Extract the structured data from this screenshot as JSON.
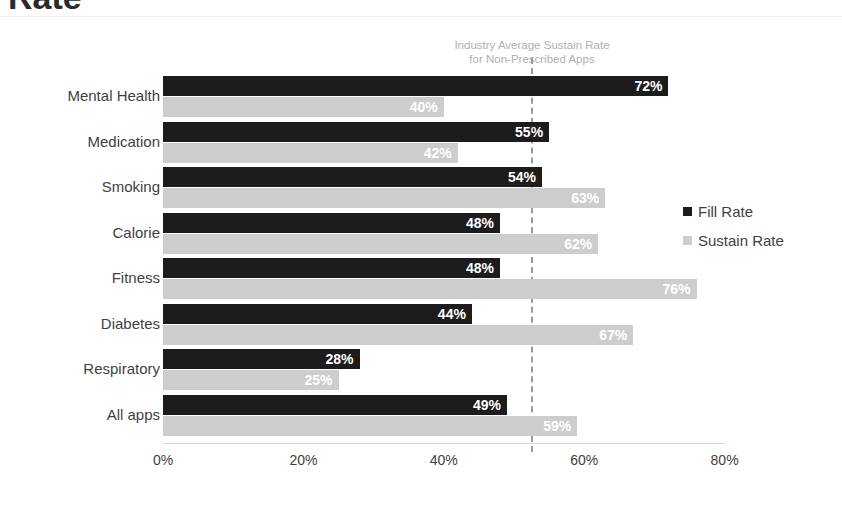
{
  "page": {
    "title_fragment": "Rate"
  },
  "legend": {
    "items": [
      {
        "label": "Fill Rate",
        "color": "#1c1c1c"
      },
      {
        "label": "Sustain Rate",
        "color": "#cdcdcd"
      }
    ]
  },
  "annotation": {
    "line1": "Industry Average Sustain Rate",
    "line2": "for Non-Prescribed Apps"
  },
  "chart_data": {
    "type": "bar",
    "orientation": "horizontal",
    "title": "Rate",
    "xlabel": "",
    "ylabel": "",
    "xlim": [
      0,
      85
    ],
    "grid": false,
    "legend_position": "right",
    "tick_labels": [
      "0%",
      "20%",
      "40%",
      "60%",
      "80%"
    ],
    "ticks": [
      0,
      20,
      40,
      60,
      80
    ],
    "categories": [
      "Mental Health",
      "Medication",
      "Smoking",
      "Calorie",
      "Fitness",
      "Diabetes",
      "Respiratory",
      "All apps"
    ],
    "series": [
      {
        "name": "Fill Rate",
        "color": "#1c1c1c",
        "values": [
          72,
          55,
          54,
          48,
          48,
          44,
          28,
          49
        ],
        "labels": [
          "72%",
          "55%",
          "54%",
          "48%",
          "48%",
          "44%",
          "28%",
          "49%"
        ]
      },
      {
        "name": "Sustain Rate",
        "color": "#cdcdcd",
        "values": [
          40,
          42,
          63,
          62,
          76,
          67,
          25,
          59
        ],
        "labels": [
          "40%",
          "42%",
          "63%",
          "62%",
          "76%",
          "67%",
          "25%",
          "59%"
        ]
      }
    ],
    "annotations": [
      {
        "text": "Industry Average Sustain Rate for Non-Prescribed Apps",
        "value": 52.7,
        "style": "dashed-vertical-line"
      }
    ]
  }
}
